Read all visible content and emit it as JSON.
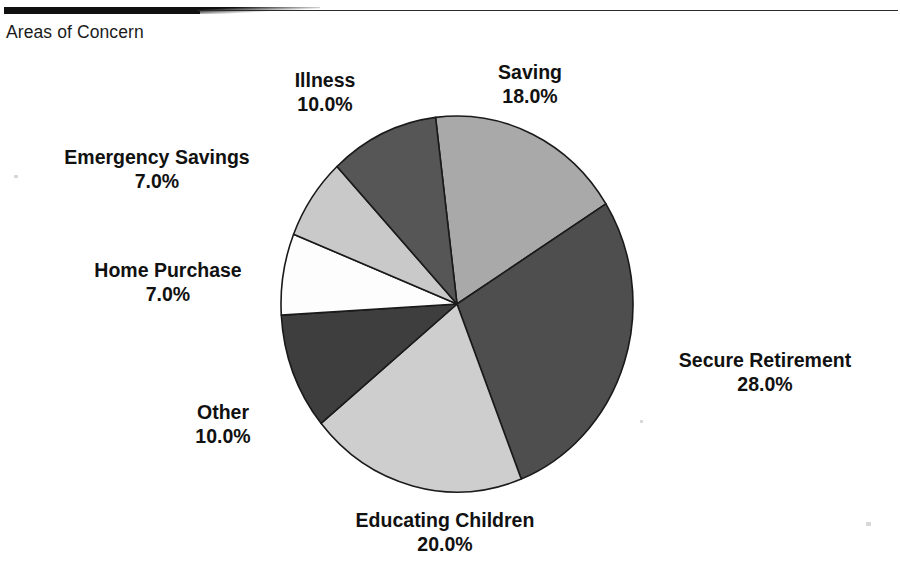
{
  "caption": "Areas of Concern",
  "chart_data": {
    "type": "pie",
    "title": "Areas of Concern",
    "value_suffix": "%",
    "value_format": "0.0%",
    "total": 100.0,
    "start_angle_deg": -7,
    "direction": "clockwise",
    "legend": "none (direct labels)",
    "grid": false,
    "categories": [
      "Saving",
      "Secure Retirement",
      "Educating Children",
      "Other",
      "Home Purchase",
      "Emergency Savings",
      "Illness"
    ],
    "values": [
      18.0,
      28.0,
      20.0,
      10.0,
      7.0,
      7.0,
      10.0
    ],
    "slices": [
      {
        "name": "saving",
        "label": "Saving",
        "value_label": "18.0%",
        "value": 18.0,
        "color": "#a9a9a9"
      },
      {
        "name": "secure-retirement",
        "label": "Secure Retirement",
        "value_label": "28.0%",
        "value": 28.0,
        "color": "#4e4e4e"
      },
      {
        "name": "educating-children",
        "label": "Educating Children",
        "value_label": "20.0%",
        "value": 20.0,
        "color": "#cecece"
      },
      {
        "name": "other",
        "label": "Other",
        "value_label": "10.0%",
        "value": 10.0,
        "color": "#3e3e3e"
      },
      {
        "name": "home-purchase",
        "label": "Home Purchase",
        "value_label": "7.0%",
        "value": 7.0,
        "color": "#fdfdfd"
      },
      {
        "name": "emergency-savings",
        "label": "Emergency Savings",
        "value_label": "7.0%",
        "value": 7.0,
        "color": "#c9c9c9"
      },
      {
        "name": "illness",
        "label": "Illness",
        "value_label": "10.0%",
        "value": 10.0,
        "color": "#565656"
      }
    ],
    "geometry": {
      "center_x": 457,
      "center_y": 304,
      "radius_x": 176,
      "radius_y": 188,
      "outline_color": "#1a1a1a"
    }
  }
}
